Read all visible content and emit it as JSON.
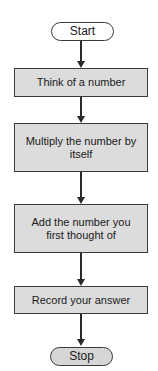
{
  "flowchart": {
    "start": {
      "label": "Start"
    },
    "steps": [
      {
        "label": "Think of a number"
      },
      {
        "label": "Multiply the number by itself"
      },
      {
        "label": "Add the number you first thought of"
      },
      {
        "label": "Record your answer"
      }
    ],
    "stop": {
      "label": "Stop"
    }
  },
  "colors": {
    "box_fill": "#dcdcdc",
    "border": "#3a3a3a",
    "arrow": "#2a2a2a"
  }
}
